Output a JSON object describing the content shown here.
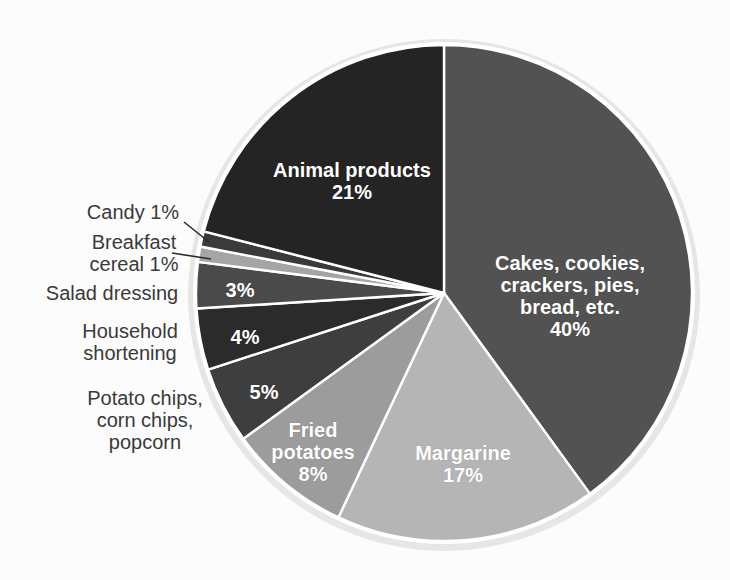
{
  "chart_data": {
    "type": "pie",
    "title": "",
    "start_angle_deg": 0,
    "direction": "clockwise",
    "total_percent": 100,
    "divider_color": "#ffffff",
    "rim_color": "#e6e6e6",
    "background_color": "#fcfcfc",
    "callout_text_color": "#3a3a3a",
    "inside_label_color": "#ffffff",
    "slices": [
      {
        "label": "Cakes, cookies, crackers, pies, bread, etc.",
        "value": 40,
        "color": "#525252",
        "label_placement": "inside",
        "label_display": "Cakes, cookies,\ncrackers, pies,\nbread, etc.\n40%"
      },
      {
        "label": "Margarine",
        "value": 17,
        "color": "#b5b5b5",
        "label_placement": "inside",
        "label_display": "Margarine\n17%"
      },
      {
        "label": "Fried potatoes",
        "value": 8,
        "color": "#9c9c9c",
        "label_placement": "inside",
        "label_display": "Fried\npotatoes\n8%"
      },
      {
        "label": "Potato chips, corn chips, popcorn",
        "value": 5,
        "color": "#3e3e3e",
        "label_placement": "inside-pct-outside-name",
        "label_display": "5%",
        "outside_label": "Potato chips,\ncorn chips,\npopcorn"
      },
      {
        "label": "Household shortening",
        "value": 4,
        "color": "#2b2b2b",
        "label_placement": "inside-pct-outside-name",
        "label_display": "4%",
        "outside_label": "Household\nshortening"
      },
      {
        "label": "Salad dressing",
        "value": 3,
        "color": "#4a4a4a",
        "label_placement": "inside-pct-outside-name",
        "label_display": "3%",
        "outside_label": "Salad dressing"
      },
      {
        "label": "Breakfast cereal",
        "value": 1,
        "color": "#a5a5a5",
        "label_placement": "outside-with-leader",
        "outside_label": "Breakfast\ncereal 1%"
      },
      {
        "label": "Candy",
        "value": 1,
        "color": "#3a3a3a",
        "label_placement": "outside-with-leader",
        "outside_label": "Candy 1%"
      },
      {
        "label": "Animal products",
        "value": 21,
        "color": "#242424",
        "label_placement": "inside",
        "label_display": "Animal products\n21%"
      }
    ]
  }
}
